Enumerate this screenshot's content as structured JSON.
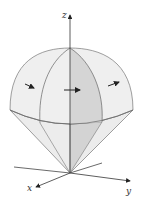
{
  "diagram": {
    "axes": {
      "x_label": "x",
      "y_label": "y",
      "z_label": "z"
    },
    "colors": {
      "surface_light": "#ededed",
      "surface_shaded": "#d4d4d4",
      "edge": "#6a6a6a",
      "axis": "#333333",
      "arrow": "#222222"
    },
    "arrows_count": 3
  }
}
